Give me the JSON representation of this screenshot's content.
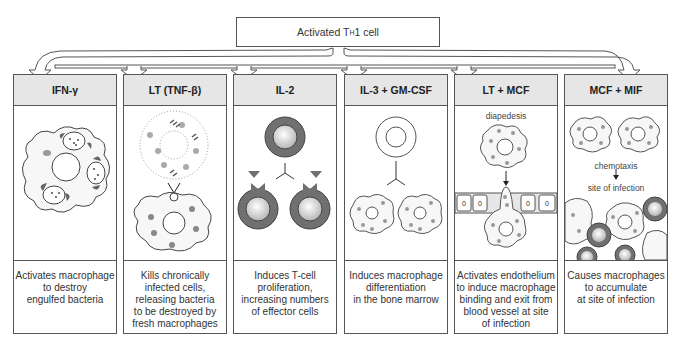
{
  "source": {
    "label": "Activated T",
    "subscript": "H",
    "suffix": "1 cell"
  },
  "columns": [
    {
      "header": "IFN-γ",
      "description": "Activates macrophage\nto destroy\nengulfed bacteria"
    },
    {
      "header": "LT (TNF-β)",
      "description": "Kills chronically\ninfected cells,\nreleasing bacteria\nto be destroyed by\nfresh macrophages"
    },
    {
      "header": "IL-2",
      "description": "Induces T-cell\nproliferation,\nincreasing numbers\nof effector cells"
    },
    {
      "header": "IL-3 + GM-CSF",
      "description": "Induces macrophage\ndifferentiation\nin the bone marrow"
    },
    {
      "header": "LT + MCF",
      "description": "Activates endothelium\nto induce macrophage\nbinding and exit from\nblood vessel at site\nof infection",
      "labels": {
        "diapedesis": "diapedesis",
        "endothelium_cell": "0"
      }
    },
    {
      "header": "MCF + MIF",
      "description": "Causes macrophages\nto accumulate\nat site of infection",
      "labels": {
        "chemotaxis": "chemotaxis",
        "site": "site of infection"
      }
    }
  ],
  "colors": {
    "header_bg": "#e6e6e6",
    "border": "#555555",
    "cell_dark": "#6e6e6e",
    "granule": "#8a8a8a"
  }
}
